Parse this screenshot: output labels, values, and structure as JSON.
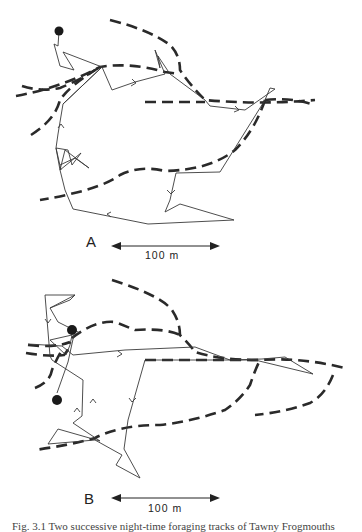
{
  "figure": {
    "panels": [
      {
        "id": "A",
        "label": "A",
        "scale_bar": {
          "label": "100 m",
          "length_m": 100
        }
      },
      {
        "id": "B",
        "label": "B",
        "scale_bar": {
          "label": "100 m",
          "length_m": 100
        }
      }
    ],
    "legend": {
      "solid_line": "foraging track",
      "dashed_line": "boundary",
      "filled_circle": "roost / start point",
      "arrow": "direction of movement"
    },
    "caption": "Fig. 3.1   Two successive night-time foraging tracks of Tawny Frogmouths"
  },
  "colors": {
    "background": "#ffffff",
    "track": "#3a3a3a",
    "boundary": "#2a2a2a",
    "roost": "#1a1a1a"
  }
}
